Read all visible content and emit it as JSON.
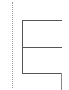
{
  "diagram": {
    "type": "tree-connector",
    "colors": {
      "guide_line": "#9a9a9a",
      "connector_line": "#555555",
      "background": "#ffffff"
    },
    "guide": {
      "x": 12,
      "y_start": 2,
      "y_end": 88,
      "style": "dotted"
    },
    "connector": {
      "trunk": {
        "x": 22,
        "y_start": 20,
        "y_end": 74
      },
      "branches": [
        {
          "y": 20,
          "x_start": 22,
          "x_end": 62
        },
        {
          "y": 47,
          "x_start": 22,
          "x_end": 62
        },
        {
          "y": 73,
          "x_start": 22,
          "x_end": 62
        }
      ],
      "tail": {
        "x": 61,
        "y_start": 73,
        "y_end": 90
      }
    }
  }
}
